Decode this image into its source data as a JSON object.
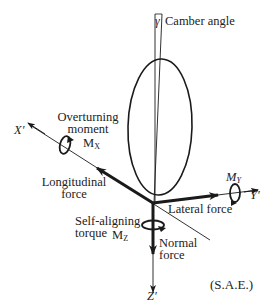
{
  "diagram": {
    "colors": {
      "ink": "#1a1a1a",
      "background": "#ffffff"
    },
    "labels": {
      "camber_symbol": "γ",
      "camber_angle": "Camber angle",
      "overturning_line1": "Overturning",
      "overturning_line2": "moment",
      "mx_main": "M",
      "mx_sub": "X",
      "x_axis": "X′",
      "longitudinal_line1": "Longitudinal",
      "longitudinal_line2": "force",
      "my_main": "M",
      "my_sub": "Y",
      "y_axis": "Y′",
      "lateral_force": "Lateral force",
      "self_aligning_line1": "Self-aligning",
      "self_aligning_line2": "torque",
      "mz_main": "M",
      "mz_sub": "Z",
      "normal_line1": "Normal",
      "normal_line2": "force",
      "z_axis": "Z′",
      "convention": "(S.A.E.)"
    }
  }
}
